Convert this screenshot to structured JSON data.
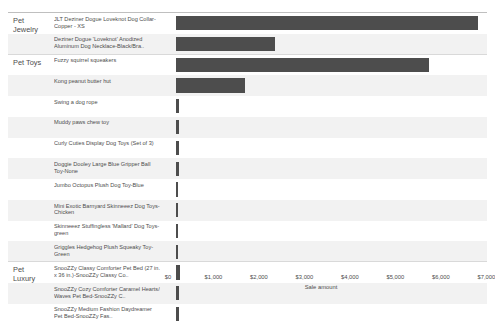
{
  "chart_data": {
    "type": "bar",
    "orientation": "horizontal",
    "title": "",
    "xlabel": "Sale amount",
    "ylabel": "",
    "xlim": [
      0,
      7300
    ],
    "xticks": [
      0,
      1000,
      2000,
      3000,
      4000,
      5000,
      6000,
      7000
    ],
    "xticklabels": [
      "$0",
      "$1,000",
      "$2,000",
      "$3,000",
      "$4,000",
      "$5,000",
      "$6,000",
      "$7,000"
    ],
    "grid": false,
    "legend": "none",
    "bar_color": "#4d4d4d",
    "groups": [
      {
        "category": "Pet Jewelry",
        "items": [
          {
            "label": "JLT Deziner Dogue Loveknot Dog Collar-Copper - XS",
            "value": 6650
          },
          {
            "label": "Deziner Dogue 'Loveknot' Anodized Aluminum Dog Necklace-Black/Bra..",
            "value": 2180
          }
        ]
      },
      {
        "category": "Pet Toys",
        "items": [
          {
            "label": "Fuzzy squirrel squeakers",
            "value": 5560
          },
          {
            "label": "Kong peanut butter hut",
            "value": 1510
          },
          {
            "label": "Swing a dog rope",
            "value": 75
          },
          {
            "label": "Muddy paws chew toy",
            "value": 70
          },
          {
            "label": "Curly Cuties Display Dog Toys (Set of 3)",
            "value": 60
          },
          {
            "label": "Doggie Dooley Large Blue Gripper Ball Toy-None",
            "value": 58
          },
          {
            "label": "Jumbo Octopus Plush Dog Toy-Blue",
            "value": 52
          },
          {
            "label": "Mini Exotic Barnyard Skinneeez Dog Toys-Chicken",
            "value": 48
          },
          {
            "label": "Skinneeez Stuffingless 'Mallard' Dog Toys-green",
            "value": 45
          },
          {
            "label": "Griggles Hedgehog Plush Squeaky Toy-Green",
            "value": 40
          }
        ]
      },
      {
        "category": "Pet Luxury",
        "items": [
          {
            "label": "SnooZZy Classy Comforter Pet Bed (27 in. x 36 in.)-SnooZZy Classy Co..",
            "value": 90
          },
          {
            "label": "SnooZZy Cozy Comforter Caramel Hearts/ Waves Pet Bed-SnooZZy C..",
            "value": 72
          },
          {
            "label": "SnooZZy Medium Fashion Daydreamer Pet Bed-SnooZZy Fas..",
            "value": 66
          }
        ]
      }
    ]
  }
}
